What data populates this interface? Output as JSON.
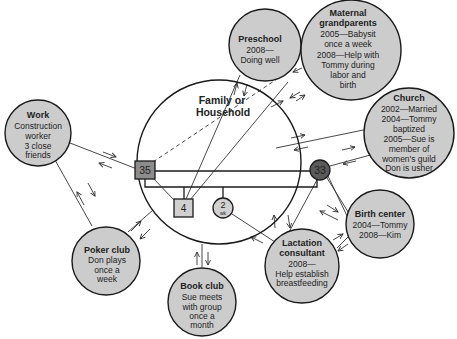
{
  "diagram": {
    "type": "ecomap",
    "center": {
      "title_line1": "Family or",
      "title_line2": "Household",
      "members": {
        "father": {
          "label": "35",
          "shape": "square",
          "color": "#8c8c8c"
        },
        "mother": {
          "label": "33",
          "shape": "circle",
          "color": "#5a5a5a"
        },
        "son": {
          "label": "4",
          "shape": "square",
          "color": "#d0d0d0"
        },
        "daughter": {
          "label_top": "2",
          "label_bottom": "wk",
          "shape": "circle",
          "color": "#d0d0d0"
        }
      }
    },
    "nodes": {
      "work": {
        "title": "Work",
        "lines": [
          "Construction",
          "worker",
          "3 close",
          "friends"
        ]
      },
      "preschool": {
        "title": "Preschool",
        "lines": [
          "2008—",
          "Doing well"
        ]
      },
      "grandparents": {
        "title_line1": "Maternal",
        "title_line2": "grandparents",
        "lines": [
          "2005—Babysit",
          "once a week",
          "2008—Help with",
          "Tommy during",
          "labor and",
          "birth"
        ]
      },
      "church": {
        "title": "Church",
        "lines": [
          "2002—Married",
          "2004—Tommy",
          "baptized",
          "2005—Sue is",
          "member of",
          "women's guild",
          "Don is usher"
        ]
      },
      "birth_center": {
        "title": "Birth center",
        "lines": [
          "2004—Tommy",
          "2008—Kim"
        ]
      },
      "lactation": {
        "title_line1": "Lactation",
        "title_line2": "consultant",
        "lines": [
          "2008—",
          "Help establish",
          "breastfeeding"
        ]
      },
      "book_club": {
        "title": "Book club",
        "lines": [
          "Sue meets",
          "with group",
          "once a",
          "month"
        ]
      },
      "poker_club": {
        "title": "Poker club",
        "lines": [
          "Don plays",
          "once a",
          "week"
        ]
      }
    },
    "colors": {
      "node_fill": "#cccccc",
      "stroke": "#1a1a1a",
      "background": "#ffffff"
    }
  }
}
